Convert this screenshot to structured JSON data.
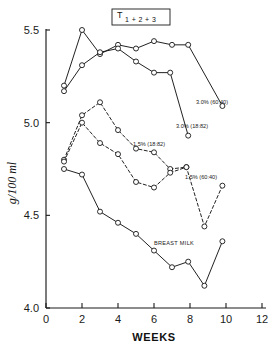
{
  "chart_data": {
    "type": "line",
    "title_main": "T",
    "title_sub": "1 + 2 + 3",
    "xlabel": "WEEKS",
    "ylabel": "g/100 ml",
    "xlim": [
      0,
      12
    ],
    "ylim": [
      4.0,
      5.5
    ],
    "xticks": [
      0,
      2,
      4,
      6,
      8,
      10,
      12
    ],
    "xtick_labels": [
      "0",
      "2",
      "4",
      "6",
      "8",
      "10",
      "12"
    ],
    "yticks": [
      4.0,
      4.5,
      5.0,
      5.5
    ],
    "ytick_labels": [
      "4.0",
      "4.5",
      "5.0",
      "5.5"
    ],
    "grid": false,
    "legend_position": "inline-annotations",
    "series": [
      {
        "name": "3.0% (60:40)",
        "label": "3.0% (60:40)",
        "style": "solid",
        "marker": "open-circle",
        "x": [
          1.0,
          2.0,
          3.0,
          4.0,
          5.0,
          6.0,
          7.0,
          7.9,
          9.8
        ],
        "y": [
          5.2,
          5.5,
          5.37,
          5.42,
          5.4,
          5.44,
          5.42,
          5.42,
          5.09
        ],
        "annot_x": 7.9,
        "annot_y": 5.17
      },
      {
        "name": "3.0% (18:82)",
        "label": "3.0% (18:82)",
        "style": "solid",
        "marker": "open-circle",
        "x": [
          1.0,
          2.0,
          3.0,
          4.0,
          5.0,
          6.0,
          6.9,
          7.9
        ],
        "y": [
          5.17,
          5.31,
          5.38,
          5.4,
          5.33,
          5.27,
          5.27,
          4.93
        ]
      },
      {
        "name": "1.5% (18:82)",
        "label": "1.5% (18:82)",
        "style": "dashed",
        "marker": "open-circle",
        "x": [
          1.0,
          2.0,
          3.0,
          4.0,
          5.0,
          6.0,
          6.9,
          7.8
        ],
        "y": [
          4.8,
          5.04,
          5.11,
          4.96,
          4.86,
          4.84,
          4.75,
          4.76
        ]
      },
      {
        "name": "1.5% (60:40)",
        "label": "1.5% (60:40)",
        "style": "dashed",
        "marker": "open-circle",
        "x": [
          1.0,
          2.0,
          3.0,
          4.0,
          5.0,
          6.0,
          6.9,
          7.8,
          8.8,
          9.8
        ],
        "y": [
          4.79,
          5.0,
          4.89,
          4.83,
          4.68,
          4.65,
          4.73,
          4.76,
          4.44,
          4.66
        ]
      },
      {
        "name": "BREAST MILK",
        "label": "BREAST MILK",
        "style": "solid",
        "marker": "open-circle",
        "x": [
          1.0,
          2.0,
          3.0,
          4.0,
          5.0,
          6.0,
          7.0,
          7.9,
          8.8,
          9.8
        ],
        "y": [
          4.75,
          4.72,
          4.52,
          4.46,
          4.4,
          4.31,
          4.22,
          4.25,
          4.12,
          4.36
        ]
      }
    ]
  },
  "annotations": [
    {
      "id": "a-30-6040",
      "text": "3.0% (60:40)"
    },
    {
      "id": "a-30-1882",
      "text": "3.0% (18:82)"
    },
    {
      "id": "a-15-1882",
      "text": "1.5% (18:82)"
    },
    {
      "id": "a-15-6040",
      "text": "1.5% (60:40)"
    },
    {
      "id": "a-breast",
      "text": "BREAST MILK"
    }
  ],
  "colors": {
    "ink": "#151515",
    "background": "#ffffff",
    "marker_fill": "#ffffff"
  }
}
